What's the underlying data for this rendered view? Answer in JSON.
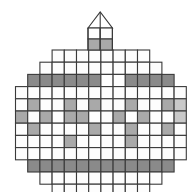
{
  "figure": {
    "kind": "pixel-grid-diagram",
    "width": 188,
    "height": 192,
    "background_color": "#ffffff"
  },
  "palette": {
    "background": "#ffffff",
    "cell_empty": "#fdfdfd",
    "cell_light": "#c9c9c9",
    "cell_mid": "#a9a9a9",
    "cell_dark": "#8a8a8a",
    "stroke": "#3a3a3a",
    "stroke_light": "#555555"
  },
  "geometry": {
    "cell_size": 12.2,
    "origin_x": 15.5,
    "origin_y": 50.0,
    "columns": 14,
    "rows": 11,
    "stroke_width": 1.1
  },
  "spire": {
    "label": "tower-spire",
    "base_x": 88.0,
    "base_y": 50.0,
    "width": 24.4,
    "roof_height": 16.0,
    "apex_x": 100.2,
    "apex_y": 12.0,
    "rows": [
      {
        "label": "spire-row-upper",
        "fills": [
          "empty",
          "empty"
        ]
      },
      {
        "label": "spire-row-lower",
        "fills": [
          "mid",
          "mid"
        ]
      }
    ]
  },
  "grid": {
    "description": "Octagonal / rounded pixel grid, 11 rows. Each row lists its starting column index and the fill code for each cell, left to right.",
    "fill_codes": {
      "e": "empty",
      "l": "light",
      "m": "mid",
      "d": "dark"
    },
    "rows": [
      {
        "index": 0,
        "start_col": 3,
        "cells": [
          "e",
          "e",
          "e",
          "e",
          "e",
          "e",
          "e",
          "e"
        ]
      },
      {
        "index": 1,
        "start_col": 2,
        "cells": [
          "e",
          "e",
          "e",
          "e",
          "e",
          "e",
          "e",
          "e",
          "e",
          "e"
        ]
      },
      {
        "index": 2,
        "start_col": 1,
        "cells": [
          "d",
          "d",
          "d",
          "d",
          "d",
          "d",
          "e",
          "e",
          "d",
          "d",
          "d",
          "d"
        ]
      },
      {
        "index": 3,
        "start_col": 0,
        "cells": [
          "e",
          "e",
          "e",
          "e",
          "e",
          "e",
          "e",
          "e",
          "e",
          "e",
          "e",
          "e",
          "e",
          "e"
        ]
      },
      {
        "index": 4,
        "start_col": 0,
        "cells": [
          "e",
          "m",
          "e",
          "e",
          "m",
          "e",
          "m",
          "e",
          "e",
          "m",
          "e",
          "e",
          "m",
          "l"
        ]
      },
      {
        "index": 5,
        "start_col": 0,
        "cells": [
          "m",
          "e",
          "m",
          "e",
          "m",
          "m",
          "e",
          "e",
          "m",
          "e",
          "m",
          "e",
          "e",
          "l"
        ]
      },
      {
        "index": 6,
        "start_col": 0,
        "cells": [
          "e",
          "m",
          "e",
          "e",
          "e",
          "e",
          "m",
          "e",
          "e",
          "m",
          "e",
          "e",
          "m",
          "e"
        ]
      },
      {
        "index": 7,
        "start_col": 0,
        "cells": [
          "e",
          "e",
          "e",
          "e",
          "m",
          "e",
          "e",
          "e",
          "e",
          "m",
          "e",
          "e",
          "e",
          "e"
        ]
      },
      {
        "index": 8,
        "start_col": 0,
        "cells": [
          "e",
          "e",
          "e",
          "e",
          "e",
          "e",
          "e",
          "e",
          "e",
          "e",
          "e",
          "e",
          "e",
          "e"
        ]
      },
      {
        "index": 9,
        "start_col": 1,
        "cells": [
          "d",
          "d",
          "d",
          "d",
          "d",
          "d",
          "d",
          "d",
          "d",
          "d",
          "d",
          "d"
        ]
      },
      {
        "index": 10,
        "start_col": 2,
        "cells": [
          "e",
          "e",
          "e",
          "e",
          "e",
          "e",
          "e",
          "e",
          "e",
          "e"
        ]
      },
      {
        "index": 11,
        "start_col": 3,
        "cells": [
          "e",
          "e",
          "e",
          "e",
          "e",
          "e",
          "e",
          "e"
        ]
      }
    ]
  },
  "legend": {
    "items": [
      {
        "code": "e",
        "label": "empty cell",
        "color": "#fdfdfd"
      },
      {
        "code": "l",
        "label": "light shaded cell",
        "color": "#c9c9c9"
      },
      {
        "code": "m",
        "label": "mid shaded cell",
        "color": "#a9a9a9"
      },
      {
        "code": "d",
        "label": "dark shaded cell",
        "color": "#8a8a8a"
      }
    ]
  }
}
